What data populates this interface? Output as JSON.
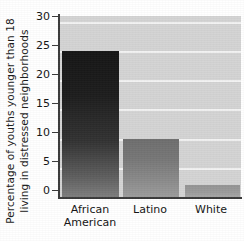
{
  "chart_data": {
    "type": "bar",
    "title": "",
    "xlabel": "",
    "ylabel": "Percentage of youths younger than 18 living in distressed neighborhoods",
    "ylabel_line1": "Percentage of youths younger than 18",
    "ylabel_line2": "living in distressed neighborhoods",
    "categories": [
      "African American",
      "Latino",
      "White"
    ],
    "category_lines": [
      [
        "African",
        "American"
      ],
      [
        "Latino"
      ],
      [
        "White"
      ]
    ],
    "values": [
      25,
      10,
      2
    ],
    "ylim": [
      0,
      31
    ],
    "yticks": [
      0,
      5,
      10,
      15,
      20,
      25,
      30
    ],
    "ytick_labels": [
      "0",
      "5",
      "10",
      "15",
      "20",
      "25",
      "30"
    ],
    "grid": true,
    "grid_color": "#f2f2f2",
    "legend": false,
    "plot_background": "#d4d4d4",
    "axis_color": "#3a3a3a",
    "bar_colors": [
      "#1d1d1d",
      "#777777",
      "#9b9b9b"
    ]
  }
}
